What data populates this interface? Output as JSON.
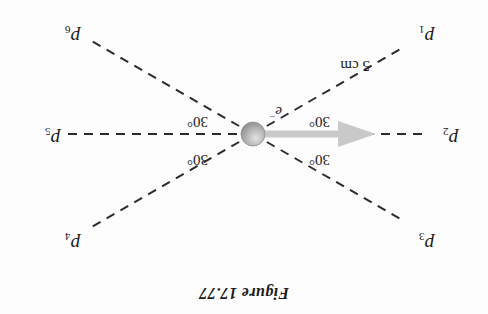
{
  "figure": {
    "title": "Figure 17.77",
    "center_particle_label": "e",
    "center_particle_charge_sign": "−",
    "distance_label": "5 cm",
    "background_color": "#fdfdfd",
    "line_color": "#2b2b2b",
    "arrow_color": "#c9c9c9",
    "sphere_color": "#a8a8a8",
    "rotation_degrees": 180
  },
  "points": [
    {
      "name": "p1",
      "label": "p",
      "subscript": "1",
      "x": 62,
      "y": 279,
      "angle_deg": 210
    },
    {
      "name": "p2",
      "label": "p",
      "subscript": "2",
      "x": 38,
      "y": 177,
      "angle_deg": 180
    },
    {
      "name": "p3",
      "label": "p",
      "subscript": "3",
      "x": 62,
      "y": 72,
      "angle_deg": 150
    },
    {
      "name": "p4",
      "label": "p",
      "subscript": "4",
      "x": 420,
      "y": 72,
      "angle_deg": 30
    },
    {
      "name": "p5",
      "label": "p",
      "subscript": "5",
      "x": 440,
      "y": 177,
      "angle_deg": 0
    },
    {
      "name": "p6",
      "label": "p",
      "subscript": "6",
      "x": 420,
      "y": 279,
      "angle_deg": 330
    }
  ],
  "angles": [
    {
      "name": "angle-upper-left",
      "text": "30°",
      "x": 166,
      "y": 154
    },
    {
      "name": "angle-lower-left",
      "text": "30°",
      "x": 166,
      "y": 192
    },
    {
      "name": "angle-upper-right",
      "text": "30°",
      "x": 288,
      "y": 154
    },
    {
      "name": "angle-lower-right",
      "text": "30°",
      "x": 288,
      "y": 192
    }
  ],
  "arrow": {
    "name": "velocity-arrow",
    "from_x": 233,
    "from_y": 180,
    "to_x": 118,
    "to_y": 180
  }
}
